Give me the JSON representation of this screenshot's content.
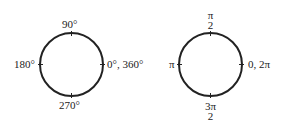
{
  "degrees_circle": {
    "top": "90°",
    "left": "180°",
    "right": "0°, 360°",
    "bottom": "270°"
  },
  "radians_circle": {
    "top": {
      "num": "π",
      "den": "2"
    },
    "left": "π",
    "right": "0, 2π",
    "bottom": {
      "num": "3π",
      "den": "2"
    }
  },
  "colors": {
    "stroke": "#222222",
    "background": "#ffffff"
  }
}
